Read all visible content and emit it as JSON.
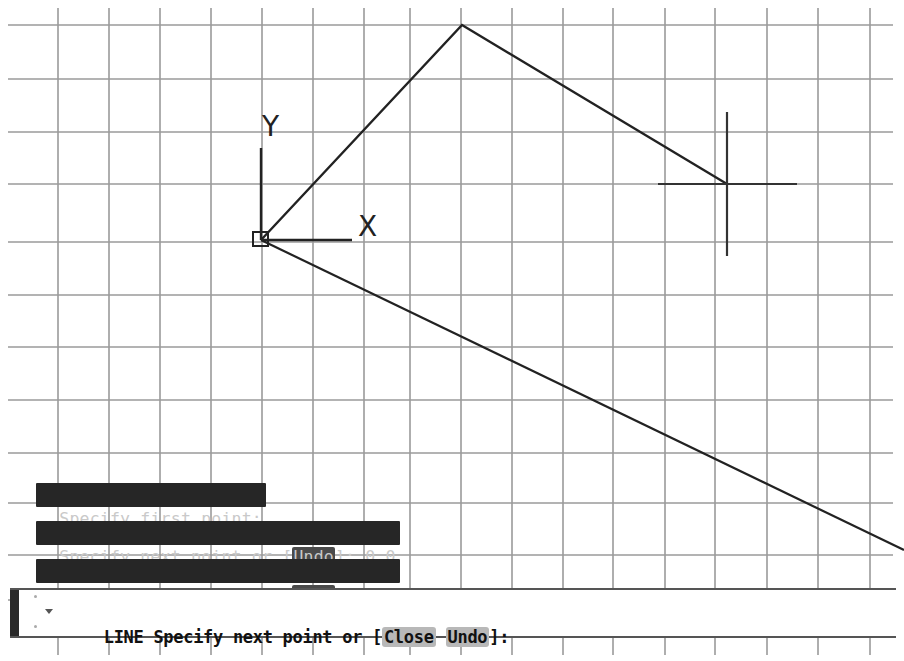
{
  "drawing": {
    "grid": {
      "color": "#9a9a9a",
      "x_lines": [
        58,
        109,
        160,
        211,
        262,
        313,
        364,
        410,
        461,
        512,
        563,
        613,
        665,
        715,
        767,
        818,
        870
      ],
      "y_lines": [
        25,
        79,
        132,
        184,
        242,
        295,
        347,
        400,
        453,
        503,
        555,
        600
      ],
      "extent": {
        "x0": 8,
        "x1": 893,
        "y0": 8,
        "y1": 655
      }
    },
    "ucs_icon": {
      "x_label": "X",
      "y_label": "Y",
      "origin": [
        261,
        240
      ]
    },
    "line_color": "#222222",
    "polyline": [
      [
        261,
        240
      ],
      [
        462,
        25
      ],
      [
        727,
        184
      ]
    ],
    "rubber_band": {
      "from": [
        261,
        240
      ],
      "to": [
        904,
        550
      ]
    },
    "crosshair": {
      "center": [
        727,
        184
      ],
      "h_left": 658,
      "h_right": 797,
      "v_top": 112,
      "v_bottom": 256
    }
  },
  "command_history": [
    {
      "prefix": "Specify first point:",
      "option": "",
      "suffix": ""
    },
    {
      "prefix": "Specify next point or [",
      "option": "Undo",
      "suffix": "]: 0,0"
    },
    {
      "prefix": "Specify next point or [",
      "option": "Undo",
      "suffix": "]: 2,2"
    }
  ],
  "command_line": {
    "dropdown_icon": "triangle-down",
    "command": "LINE",
    "prompt": " Specify next point or [",
    "options": [
      "Close",
      "Undo"
    ],
    "suffix": "]:",
    "input_value": ""
  }
}
